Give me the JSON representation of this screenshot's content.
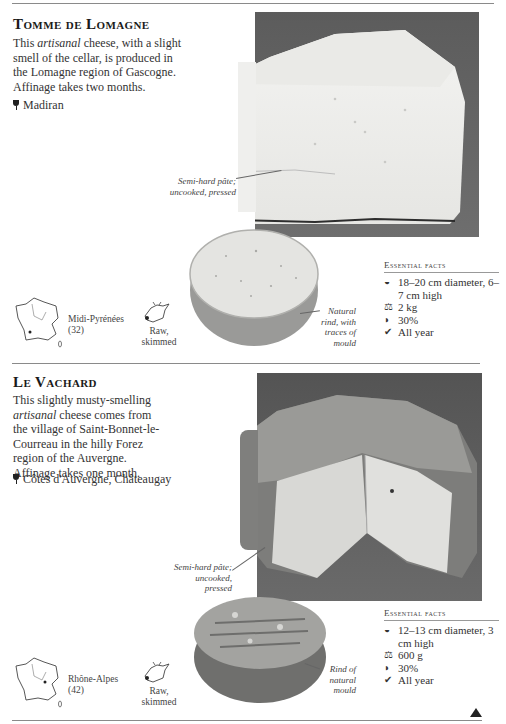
{
  "page": {
    "nav": {
      "next_icon": "triangle-up-icon"
    }
  },
  "cheeses": [
    {
      "name": "Tomme de Lomagne",
      "description_pre": "This ",
      "description_italic": "artisanal",
      "description_post": " cheese, with a slight smell of the cellar, is produced in the Lomagne region of Gascogne. Affinage takes two months.",
      "wine_icon": "wine-glass-icon",
      "wine": "Madiran",
      "captions": {
        "pate": "Semi-hard pâte; uncooked, pressed",
        "rind": "Natural rind, with traces of mould"
      },
      "region": {
        "name": "Midi-Pyrénées",
        "code": "(32)",
        "icon": "france-map-icon"
      },
      "milk": {
        "line1": "Raw,",
        "line2": "skimmed",
        "icon": "cow-head-icon"
      },
      "essential_facts": {
        "heading": "Essential facts",
        "items": [
          {
            "icon": "dimensions-icon",
            "glyph": "◒",
            "text": "18–20 cm diameter, 6–7 cm high"
          },
          {
            "icon": "weight-icon",
            "glyph": "⚖",
            "text": "2 kg"
          },
          {
            "icon": "fat-content-icon",
            "glyph": "◗",
            "text": "30%"
          },
          {
            "icon": "season-check-icon",
            "glyph": "✔",
            "text": "All year"
          }
        ]
      }
    },
    {
      "name": "Le Vachard",
      "description_pre": "This slightly musty-smelling ",
      "description_italic": "artisanal",
      "description_post": " cheese comes from the village of Saint-Bonnet-le-Courreau in the hilly Forez region of the Auvergne. Affinage takes one month.",
      "wine_icon": "wine-glass-icon",
      "wine": "Côtes d'Auvergne, Châteaugay",
      "captions": {
        "pate": "Semi-hard pâte; uncooked, pressed",
        "rind": "Rind of natural mould"
      },
      "region": {
        "name": "Rhône-Alpes",
        "code": "(42)",
        "icon": "france-map-icon"
      },
      "milk": {
        "line1": "Raw,",
        "line2": "skimmed",
        "icon": "cow-head-icon"
      },
      "essential_facts": {
        "heading": "Essential facts",
        "items": [
          {
            "icon": "dimensions-icon",
            "glyph": "◒",
            "text": "12–13 cm diameter, 3 cm high"
          },
          {
            "icon": "weight-icon",
            "glyph": "⚖",
            "text": "600 g"
          },
          {
            "icon": "fat-content-icon",
            "glyph": "◗",
            "text": "30%"
          },
          {
            "icon": "season-check-icon",
            "glyph": "✔",
            "text": "All year"
          }
        ]
      }
    }
  ]
}
